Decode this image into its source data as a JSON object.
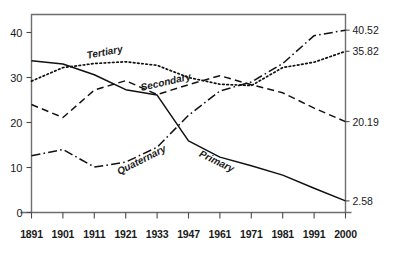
{
  "chart_data": {
    "type": "line",
    "title": "",
    "subtitle": "",
    "xlabel": "",
    "ylabel": "",
    "grid": false,
    "legend_position": "inline-annotations",
    "categories": [
      "1891",
      "1901",
      "1911",
      "1921",
      "1933",
      "1947",
      "1961",
      "1971",
      "1981",
      "1991",
      "2000"
    ],
    "xlim_categories": 11,
    "ylim": [
      0,
      44
    ],
    "yticks": [
      0,
      10,
      20,
      30,
      40
    ],
    "ytick_labels": [
      "0",
      "10",
      "20",
      "30",
      "40"
    ],
    "right_axis_end_labels": [
      {
        "series": "Quaternary",
        "value": 40.52,
        "label": "40.52"
      },
      {
        "series": "Tertiary",
        "value": 35.82,
        "label": "35.82"
      },
      {
        "series": "Secondary",
        "value": 20.19,
        "label": "20.19"
      },
      {
        "series": "Primary",
        "value": 2.58,
        "label": "2.58"
      }
    ],
    "series": [
      {
        "name": "Primary",
        "style": "solid",
        "values": [
          33.7,
          33.0,
          30.6,
          27.3,
          26.1,
          15.9,
          12.3,
          10.4,
          8.3,
          5.4,
          2.58
        ]
      },
      {
        "name": "Secondary",
        "style": "dashed",
        "values": [
          24.0,
          21.1,
          27.2,
          29.3,
          26.2,
          28.4,
          30.4,
          28.4,
          26.6,
          23.2,
          20.19
        ]
      },
      {
        "name": "Tertiary",
        "style": "dotted",
        "values": [
          29.2,
          32.2,
          33.1,
          33.5,
          32.7,
          30.0,
          28.5,
          28.2,
          32.2,
          33.4,
          35.82
        ]
      },
      {
        "name": "Quaternary",
        "style": "dash-dot",
        "values": [
          12.6,
          14.0,
          10.1,
          11.2,
          14.5,
          21.6,
          27.0,
          29.0,
          33.1,
          39.3,
          40.52
        ]
      }
    ]
  }
}
